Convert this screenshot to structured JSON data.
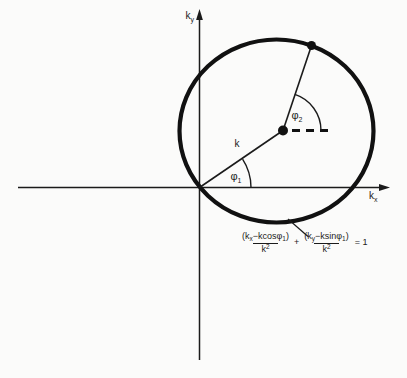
{
  "figure": {
    "colors": {
      "ink": "#1b1b1b",
      "background": "#fbfbfa"
    },
    "axis": {
      "y_label": {
        "main": "k",
        "sub": "y"
      },
      "x_label": {
        "main": "k",
        "sub": "x"
      }
    },
    "labels": {
      "radius": "k",
      "phi1": {
        "main": "φ",
        "sub": "1"
      },
      "phi2": {
        "main": "φ",
        "sub": "2"
      }
    },
    "equation": {
      "frac1": {
        "num": {
          "p1": "(k",
          "sub1": "x",
          "p2": "−kcosφ",
          "sub2": "1",
          "p3": ")"
        },
        "den": {
          "base": "k",
          "sup": "2"
        }
      },
      "operator": "+",
      "frac2": {
        "num": {
          "p1": "(k",
          "sub1": "y",
          "p2": "−ksinφ",
          "sub2": "1",
          "p3": ")"
        },
        "den": {
          "base": "k",
          "sup": "2"
        }
      },
      "result": "= 1"
    }
  }
}
